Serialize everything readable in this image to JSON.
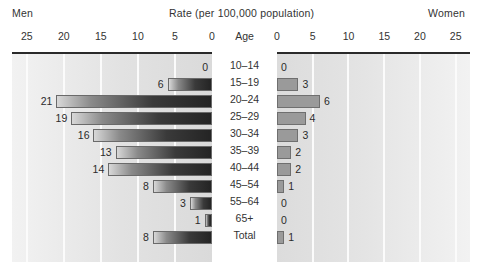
{
  "header": {
    "left_label": "Men",
    "title": "Rate (per 100,000 population)",
    "right_label": "Women"
  },
  "age_heading": "Age",
  "axis": {
    "left_ticks": [
      "25",
      "20",
      "15",
      "10",
      "5",
      "0"
    ],
    "right_ticks": [
      "0",
      "5",
      "10",
      "15",
      "20",
      "25"
    ]
  },
  "chart_data": {
    "type": "bar",
    "title": "Rate (per 100,000 population)",
    "subtype": "population-pyramid",
    "xlabel": "Rate (per 100,000 population)",
    "ylabel": "Age",
    "xlim": [
      0,
      27
    ],
    "axis_max": 25,
    "grid": true,
    "grid_interval": 5,
    "legend": "none",
    "categories": [
      "10–14",
      "15–19",
      "20–24",
      "25–29",
      "30–34",
      "35–39",
      "40–44",
      "45–54",
      "55–64",
      "65+",
      "Total"
    ],
    "series": [
      {
        "name": "Men",
        "side": "left",
        "values": [
          0,
          6,
          21,
          19,
          16,
          13,
          14,
          8,
          3,
          1,
          8
        ],
        "labels": [
          "0",
          "6",
          "21",
          "19",
          "16",
          "13",
          "14",
          "8",
          "3",
          "1",
          "8"
        ]
      },
      {
        "name": "Women",
        "side": "right",
        "values": [
          0,
          3,
          6,
          4,
          3,
          2,
          2,
          1,
          0,
          0,
          1
        ],
        "labels": [
          "0",
          "3",
          "6",
          "4",
          "3",
          "2",
          "2",
          "1",
          "0",
          "0",
          "1"
        ]
      }
    ]
  }
}
